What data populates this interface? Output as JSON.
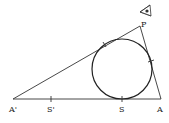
{
  "diagram": {
    "type": "geometry-incircle-triangle",
    "stroke_color": "#333333",
    "background": "#ffffff",
    "points": {
      "A_prime": {
        "label": "A'",
        "x": 13,
        "y": 99
      },
      "A": {
        "label": "A",
        "x": 161,
        "y": 99
      },
      "P": {
        "label": "P",
        "x": 140,
        "y": 26
      },
      "S_prime": {
        "label": "S'",
        "x": 51,
        "y": 99
      },
      "S": {
        "label": "S",
        "x": 122,
        "y": 99
      }
    },
    "circle": {
      "cx": 122,
      "cy": 69,
      "r": 30
    },
    "eye_symbol": {
      "name": "eye-icon",
      "x": 146,
      "y": 10
    },
    "labels": {
      "a_prime": "A'",
      "s_prime": "S'",
      "s": "S",
      "a": "A",
      "p": "P"
    }
  }
}
